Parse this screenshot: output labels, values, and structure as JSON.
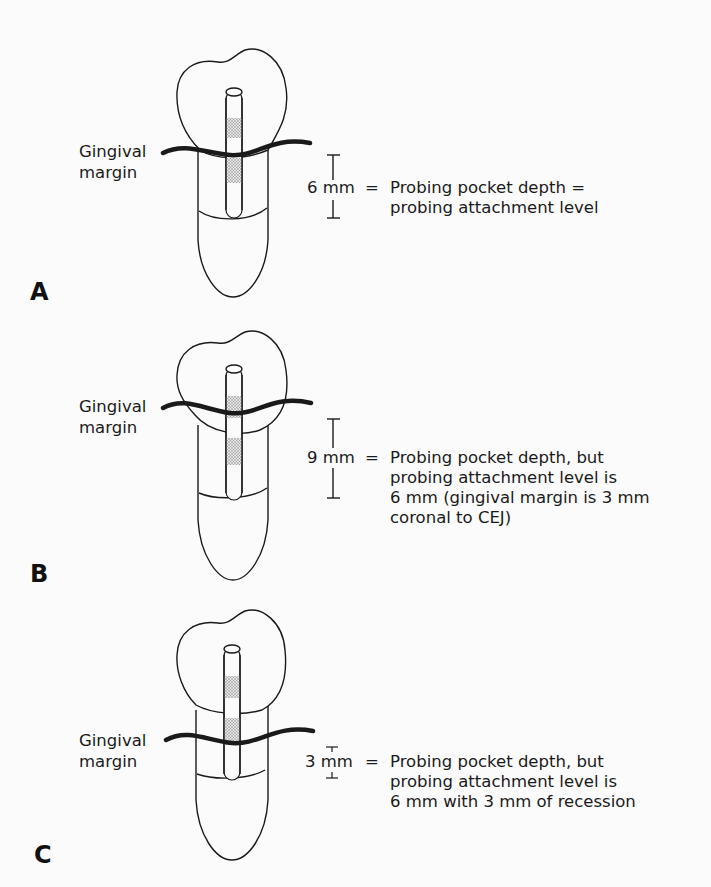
{
  "figure": {
    "panels": [
      {
        "id": "A",
        "label": "A",
        "gingival_label_line1": "Gingival",
        "gingival_label_line2": "margin",
        "measurement": "6 mm",
        "equals": "=",
        "description_lines": [
          "Probing pocket depth =",
          "probing attachment level"
        ]
      },
      {
        "id": "B",
        "label": "B",
        "gingival_label_line1": "Gingival",
        "gingival_label_line2": "margin",
        "measurement": "9 mm",
        "equals": "=",
        "description_lines": [
          "Probing pocket depth, but",
          "probing attachment level is",
          "6 mm (gingival margin is 3 mm",
          "coronal to CEJ)"
        ]
      },
      {
        "id": "C",
        "label": "C",
        "gingival_label_line1": "Gingival",
        "gingival_label_line2": "margin",
        "measurement": "3 mm",
        "equals": "=",
        "description_lines": [
          "Probing pocket depth, but",
          "probing attachment level is",
          "6 mm with 3 mm of recession"
        ]
      }
    ]
  }
}
